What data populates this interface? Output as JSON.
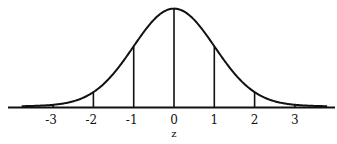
{
  "chart_data": {
    "type": "line",
    "title": "",
    "subtitle": "",
    "xlabel": "z",
    "ylabel": "",
    "xlim": [
      -3.8,
      3.8
    ],
    "ylim": [
      0,
      0.4
    ],
    "grid": false,
    "legend": null,
    "x_ticks": [
      -3,
      -2,
      -1,
      0,
      1,
      2,
      3
    ],
    "tick_labels": [
      "-3",
      "-2",
      "-1",
      "0",
      "1",
      "2",
      "3"
    ],
    "vertical_lines_at": [
      -3,
      -2,
      -1,
      0,
      1,
      2,
      3
    ],
    "series": [
      {
        "name": "density",
        "x": [
          -3,
          -2,
          -1,
          0,
          1,
          2,
          3
        ],
        "values": [
          0.0044,
          0.054,
          0.242,
          0.399,
          0.242,
          0.054,
          0.0044
        ]
      }
    ]
  },
  "colors": {
    "line": "#111111",
    "background": "#ffffff"
  }
}
